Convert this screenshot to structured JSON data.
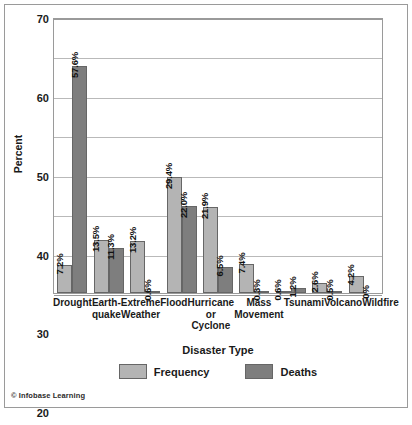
{
  "credit": "© Infobase Learning",
  "legend": {
    "position": "bottom",
    "items": [
      {
        "label": "Frequency",
        "color": "#b4b4b4",
        "swatch_name": "legend-swatch-frequency"
      },
      {
        "label": "Deaths",
        "color": "#7e7e7e",
        "swatch_name": "legend-swatch-deaths"
      }
    ]
  },
  "chart_data": {
    "type": "bar",
    "title": "",
    "xlabel": "Disaster Type",
    "ylabel": "Percent",
    "ylim": [
      0,
      70
    ],
    "yticks": [
      0,
      10,
      20,
      30,
      40,
      50,
      60,
      70
    ],
    "grid": true,
    "categories": [
      "Drought",
      "Earth-quake",
      "Extreme Weather",
      "Flood",
      "Hurricane or Cyclone",
      "Mass Movement",
      "Tsunami",
      "Volcano",
      "Wildfire"
    ],
    "category_lines": [
      [
        "Drought"
      ],
      [
        "Earth-",
        "quake"
      ],
      [
        "Extreme",
        "Weather"
      ],
      [
        "Flood"
      ],
      [
        "Hurricane",
        "or",
        "Cyclone"
      ],
      [
        "Mass",
        "Movement"
      ],
      [
        "Tsunami"
      ],
      [
        "Volcano"
      ],
      [
        "Wildfire"
      ]
    ],
    "series": [
      {
        "name": "Frequency",
        "color": "#b4b4b4",
        "values": [
          7.2,
          13.5,
          13.2,
          29.4,
          21.9,
          7.4,
          0.6,
          2.6,
          4.2
        ],
        "labels": [
          "7.2%",
          "13.5%",
          "13.2%",
          "29.4%",
          "21.9%",
          "7.4%",
          "0.6%",
          "2.6%",
          "4.2%"
        ]
      },
      {
        "name": "Deaths",
        "color": "#7e7e7e",
        "values": [
          57.6,
          11.3,
          0.6,
          22.0,
          6.5,
          0.3,
          1.2,
          0.5,
          0.0
        ],
        "labels": [
          "57.6%",
          "11.3%",
          "0.6%",
          "22.0%",
          "6.5%",
          "0.3%",
          "1.2%",
          "0.5%",
          "0%"
        ]
      }
    ]
  }
}
